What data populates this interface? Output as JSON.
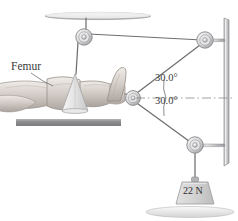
{
  "figure": {
    "labels": {
      "femur": "Femur",
      "angle_upper": "30.0°",
      "angle_lower": "30.0°",
      "weight": "22 N"
    }
  },
  "colors": {
    "line": "#6b6b6b",
    "line_dark": "#58585a",
    "metal_light": "#e4e4e6",
    "metal_mid": "#c2c2c4",
    "metal_dark": "#9a9a9c",
    "bed_bar": "#8c8c8e",
    "skin_light": "#e8e4e0",
    "skin_mid": "#cfc9c4",
    "skin_dark": "#b2aaa4",
    "splint": "#efefef",
    "weight_fill": "#d6d6d6",
    "text": "#3a3a3a",
    "dashed": "#8a8a8a",
    "background": "#ffffff"
  },
  "elements": {
    "ceiling_bar": "ceiling-support-bar",
    "top_pulley": "top-pulley",
    "upper_right_pulley": "upper-right-pulley",
    "lower_right_pulley": "lower-right-pulley",
    "center_pulley": "center-pulley",
    "vertical_post": "vertical-support-post",
    "floor_base": "floor-base",
    "bed_surface": "bed-surface-bar",
    "leg": "patient-leg",
    "foot": "patient-foot",
    "splint": "leg-splint-cone",
    "weight": "hanging-weight",
    "cords": "traction-cords",
    "axis": "horizontal-dashed-axis",
    "arcs": "angle-arcs",
    "pointer": "femur-pointer-line"
  }
}
